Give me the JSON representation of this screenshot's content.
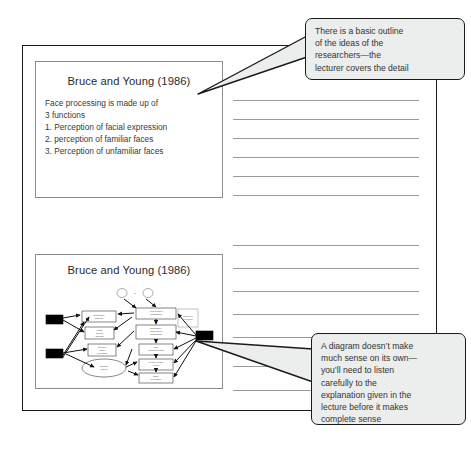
{
  "page": {
    "type": "notebook-page-with-slide-handouts",
    "note_line_count_upper": 6,
    "note_line_count_lower": 7
  },
  "slides": [
    {
      "id": "slide-1",
      "title": "Bruce and Young (1986)",
      "body_lines": [
        "Face processing is made up of",
        "3 functions",
        "1. Perception of facial expression",
        "2. perception of familiar faces",
        "3. Perception of unfamiliar faces"
      ]
    },
    {
      "id": "slide-2",
      "title": "Bruce and Young (1986)",
      "body_lines": [],
      "has_diagram": true,
      "diagram_description": "Bruce and Young face recognition flow model with boxes and arrows"
    }
  ],
  "callouts": [
    {
      "id": "callout-1",
      "text": "There is a basic outline of the ideas of the researchers—the lecturer covers the detail",
      "lines": [
        "There is a basic outline",
        "of the ideas of the",
        "researchers—the",
        "lecturer covers the detail"
      ],
      "points_to": "slide-1"
    },
    {
      "id": "callout-2",
      "text": "A diagram doesn’t make much sense on its own—you’ll need to listen carefully to the explanation given in the lecture before it makes complete sense",
      "lines": [
        "A diagram doesn’t make",
        "much sense on its own—",
        "you’ll need to listen",
        "carefully to the",
        "explanation given in the",
        "lecture before it makes",
        "complete sense"
      ],
      "points_to": "slide-2"
    }
  ],
  "colors": {
    "page_border": "#1a1a1a",
    "slide_border": "#8c8c8c",
    "rule_line": "#9a9a9a",
    "callout_fill": "#eceded",
    "callout_border": "#1a1a1a",
    "text": "#2b2b2b",
    "diagram_block": "#000000"
  }
}
